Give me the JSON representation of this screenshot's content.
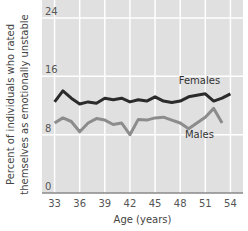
{
  "chart_data": {
    "type": "line",
    "title": "",
    "xlabel": "Age (years)",
    "ylabel_lines": [
      "Percent of individuals who rated",
      "themselves as emotionally unstable"
    ],
    "ylabel": "Percent of individuals who rated themselves as emotionally unstable",
    "ylim": [
      0,
      24
    ],
    "xlim": [
      31.5,
      55.5
    ],
    "y_ticks": [
      0,
      8,
      16,
      24
    ],
    "x_ticks": [
      33,
      36,
      39,
      42,
      45,
      48,
      51,
      54
    ],
    "grid": true,
    "legend_position": "inline labels",
    "x": [
      33,
      34,
      35,
      36,
      37,
      38,
      39,
      40,
      41,
      42,
      43,
      44,
      45,
      46,
      47,
      48,
      49,
      50,
      51,
      52,
      53,
      54
    ],
    "series": [
      {
        "name": "Females",
        "color": "#2b2b2b",
        "values": [
          12.5,
          14,
          13,
          12.2,
          12.5,
          12.3,
          13,
          12.8,
          13,
          12.5,
          12.8,
          12.6,
          13.2,
          12.6,
          12.4,
          12.6,
          13.2,
          13.4,
          13.6,
          12.6,
          13,
          13.6
        ]
      },
      {
        "name": "Males",
        "color": "#8c8c8c",
        "values": [
          9.6,
          10.3,
          9.8,
          8.4,
          9.6,
          10.2,
          10,
          9.4,
          9.6,
          8,
          10.1,
          10,
          10.3,
          10.4,
          10,
          9.6,
          8.8,
          9.6,
          10.4,
          11.6,
          9.6,
          null
        ]
      }
    ],
    "series_labels": [
      {
        "text": "Females",
        "x": 50.3,
        "y": 15.0
      },
      {
        "text": "Males",
        "x": 50.3,
        "y": 7.6
      }
    ]
  },
  "colors": {
    "plot_background": "#e0e0e0",
    "gridline": "#ffffff",
    "axis_line": "#8a8a8a",
    "females": "#2b2b2b",
    "males": "#8c8c8c"
  }
}
